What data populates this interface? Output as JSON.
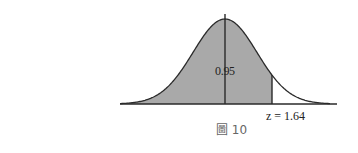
{
  "figure": {
    "type": "standard-normal-distribution",
    "shaded_area_label": "0.95",
    "cutoff_label": "z = 1.64",
    "caption": "圖 10",
    "colors": {
      "shade": "#a9a9a9",
      "line": "#2a2a2a",
      "caption": "#666666"
    }
  }
}
